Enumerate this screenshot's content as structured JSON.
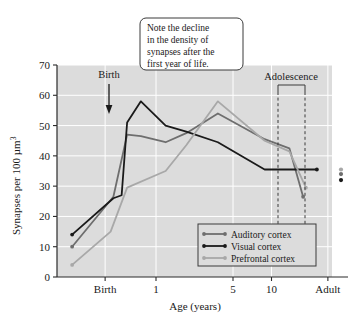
{
  "chart_data": {
    "type": "line",
    "title": "",
    "xlabel": "Age (years)",
    "ylabel": "Synapses per 100 µm",
    "ylabel_sup": "3",
    "ylim": [
      0,
      70
    ],
    "yticks": [
      0,
      10,
      20,
      30,
      40,
      50,
      60,
      70
    ],
    "xticks": [
      {
        "label": "Birth",
        "pos": 0.175
      },
      {
        "label": "1",
        "pos": 0.36
      },
      {
        "label": "5",
        "pos": 0.64
      },
      {
        "label": "10",
        "pos": 0.78
      },
      {
        "label": "Adult",
        "pos": 0.985
      }
    ],
    "grid": true,
    "legend_position": "bottom-right",
    "series": [
      {
        "name": "Auditory cortex",
        "color": "#6e6e6e",
        "points": [
          {
            "x": 0.055,
            "y": 10
          },
          {
            "x": 0.205,
            "y": 26.5
          },
          {
            "x": 0.255,
            "y": 47
          },
          {
            "x": 0.305,
            "y": 46.5
          },
          {
            "x": 0.395,
            "y": 44.5
          },
          {
            "x": 0.47,
            "y": 47.5
          },
          {
            "x": 0.585,
            "y": 54
          },
          {
            "x": 0.755,
            "y": 45.5
          },
          {
            "x": 0.845,
            "y": 42.5
          },
          {
            "x": 0.895,
            "y": 26.5
          }
        ]
      },
      {
        "name": "Visual cortex",
        "color": "#1a1a1a",
        "points": [
          {
            "x": 0.055,
            "y": 14
          },
          {
            "x": 0.205,
            "y": 26
          },
          {
            "x": 0.235,
            "y": 27
          },
          {
            "x": 0.255,
            "y": 51
          },
          {
            "x": 0.305,
            "y": 58
          },
          {
            "x": 0.395,
            "y": 50
          },
          {
            "x": 0.47,
            "y": 48
          },
          {
            "x": 0.585,
            "y": 44.5
          },
          {
            "x": 0.755,
            "y": 35.5
          },
          {
            "x": 0.945,
            "y": 35.5
          }
        ]
      },
      {
        "name": "Prefrontal cortex",
        "color": "#a8a8a8",
        "points": [
          {
            "x": 0.055,
            "y": 4
          },
          {
            "x": 0.195,
            "y": 15
          },
          {
            "x": 0.255,
            "y": 29.5
          },
          {
            "x": 0.395,
            "y": 35
          },
          {
            "x": 0.47,
            "y": 43.5
          },
          {
            "x": 0.585,
            "y": 58
          },
          {
            "x": 0.755,
            "y": 45
          },
          {
            "x": 0.845,
            "y": 41.5
          },
          {
            "x": 0.905,
            "y": 29.5
          }
        ]
      }
    ],
    "adult_points": [
      {
        "series": "Auditory cortex",
        "y": 35.5,
        "color": "#a8a8a8"
      },
      {
        "series": "Prefrontal cortex",
        "y": 34,
        "color": "#6e6e6e"
      },
      {
        "series": "Visual cortex",
        "y": 32,
        "color": "#1a1a1a"
      }
    ],
    "annotations": {
      "birth_label": "Birth",
      "adolescence_label": "Adolescence",
      "callout_lines": [
        "Note the decline",
        "in the density of",
        "synapses after the",
        "first year of life."
      ]
    }
  }
}
